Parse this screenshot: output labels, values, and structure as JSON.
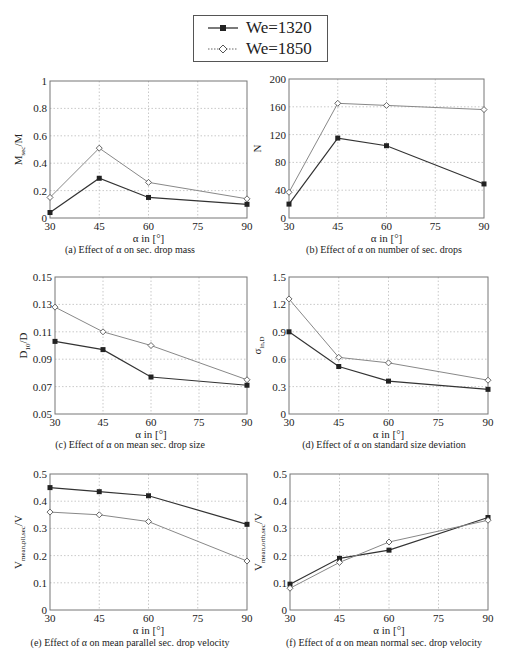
{
  "legend": {
    "items": [
      {
        "label": "We=1320",
        "marker": "filled-square",
        "line": "solid",
        "color": "#222222"
      },
      {
        "label": "We=1850",
        "marker": "open-diamond",
        "line": "dotted",
        "color": "#666666"
      }
    ]
  },
  "chart_data": [
    {
      "id": "a",
      "type": "line",
      "caption": "(a) Effect of α on sec. drop mass",
      "xlabel": "α in [°]",
      "ylabel": "M_sec/M",
      "x": [
        30,
        45,
        60,
        90
      ],
      "xticks": [
        30,
        45,
        60,
        75,
        90
      ],
      "yticks": [
        0,
        0.2,
        0.4,
        0.6,
        0.8,
        1
      ],
      "ytick_labels": [
        "0",
        "0.2",
        "0.4",
        "0.6",
        "0.8",
        "1"
      ],
      "ylim": [
        0,
        1
      ],
      "xlim": [
        30,
        90
      ],
      "grid": true,
      "series": [
        {
          "name": "We=1320",
          "values": [
            0.04,
            0.29,
            0.15,
            0.1
          ]
        },
        {
          "name": "We=1850",
          "values": [
            0.15,
            0.51,
            0.26,
            0.14
          ]
        }
      ]
    },
    {
      "id": "b",
      "type": "line",
      "caption": "(b) Effect of α on number of sec. drops",
      "xlabel": "α in [°]",
      "ylabel": "N",
      "x": [
        30,
        45,
        60,
        90
      ],
      "xticks": [
        30,
        45,
        60,
        75,
        90
      ],
      "yticks": [
        0,
        40,
        80,
        120,
        160,
        200
      ],
      "ytick_labels": [
        "0",
        "40",
        "80",
        "120",
        "160",
        "200"
      ],
      "ylim": [
        0,
        200
      ],
      "xlim": [
        30,
        90
      ],
      "grid": true,
      "series": [
        {
          "name": "We=1320",
          "values": [
            20,
            115,
            104,
            49
          ]
        },
        {
          "name": "We=1850",
          "values": [
            37,
            165,
            162,
            156
          ]
        }
      ]
    },
    {
      "id": "c",
      "type": "line",
      "caption": "(c) Effect of α on mean sec. drop size",
      "xlabel": "α in [°]",
      "ylabel": "D_10/D",
      "x": [
        30,
        45,
        60,
        90
      ],
      "xticks": [
        30,
        45,
        60,
        75,
        90
      ],
      "yticks": [
        0.05,
        0.07,
        0.09,
        0.11,
        0.13,
        0.15
      ],
      "ytick_labels": [
        "0.05",
        "0.07",
        "0.09",
        "0.11",
        "0.13",
        "0.15"
      ],
      "ylim": [
        0.05,
        0.15
      ],
      "xlim": [
        30,
        90
      ],
      "grid": true,
      "series": [
        {
          "name": "We=1320",
          "values": [
            0.103,
            0.097,
            0.077,
            0.071
          ]
        },
        {
          "name": "We=1850",
          "values": [
            0.128,
            0.11,
            0.1,
            0.075
          ]
        }
      ]
    },
    {
      "id": "d",
      "type": "line",
      "caption": "(d) Effect of α on standard size deviation",
      "xlabel": "α in [°]",
      "ylabel": "σ_ln,D",
      "x": [
        30,
        45,
        60,
        90
      ],
      "xticks": [
        30,
        45,
        60,
        75,
        90
      ],
      "yticks": [
        0,
        0.3,
        0.6,
        0.9,
        1.2,
        1.5
      ],
      "ytick_labels": [
        "0",
        "0.3",
        "0.6",
        "0.9",
        "1.2",
        "1.5"
      ],
      "ylim": [
        0,
        1.5
      ],
      "xlim": [
        30,
        90
      ],
      "grid": true,
      "series": [
        {
          "name": "We=1320",
          "values": [
            0.9,
            0.52,
            0.36,
            0.27
          ]
        },
        {
          "name": "We=1850",
          "values": [
            1.26,
            0.62,
            0.56,
            0.37
          ]
        }
      ]
    },
    {
      "id": "e",
      "type": "line",
      "caption": "(e) Effect of α on mean parallel sec. drop velocity",
      "xlabel": "α in [°]",
      "ylabel": "V_mean,pll,sec/V",
      "x": [
        30,
        45,
        60,
        90
      ],
      "xticks": [
        30,
        45,
        60,
        75,
        90
      ],
      "yticks": [
        0,
        0.1,
        0.2,
        0.3,
        0.4,
        0.5
      ],
      "ytick_labels": [
        "0",
        "0.1",
        "0.2",
        "0.3",
        "0.4",
        "0.5"
      ],
      "ylim": [
        0,
        0.5
      ],
      "xlim": [
        30,
        90
      ],
      "grid": true,
      "series": [
        {
          "name": "We=1320",
          "values": [
            0.45,
            0.435,
            0.42,
            0.315
          ]
        },
        {
          "name": "We=1850",
          "values": [
            0.36,
            0.35,
            0.325,
            0.18
          ]
        }
      ]
    },
    {
      "id": "f",
      "type": "line",
      "caption": "(f) Effect of α on mean normal sec. drop velocity",
      "xlabel": "α in [°]",
      "ylabel": "V_mean,orth,sec/V",
      "x": [
        30,
        45,
        60,
        90
      ],
      "xticks": [
        30,
        45,
        60,
        75,
        90
      ],
      "yticks": [
        0,
        0.1,
        0.2,
        0.3,
        0.4,
        0.5
      ],
      "ytick_labels": [
        "0",
        "0.1",
        "0.2",
        "0.3",
        "0.4",
        "0.5"
      ],
      "ylim": [
        0,
        0.5
      ],
      "xlim": [
        30,
        90
      ],
      "grid": true,
      "series": [
        {
          "name": "We=1320",
          "values": [
            0.095,
            0.19,
            0.22,
            0.34
          ]
        },
        {
          "name": "We=1850",
          "values": [
            0.08,
            0.175,
            0.25,
            0.33
          ]
        }
      ]
    }
  ]
}
